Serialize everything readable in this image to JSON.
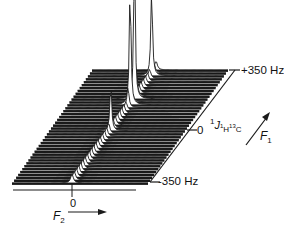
{
  "figure": {
    "type": "stacked 2D NMR plot (J-resolved)",
    "colors": {
      "trace": "#1a1a1a",
      "background": "#ffffff",
      "highlight": "#ffffff"
    }
  },
  "f1_axis": {
    "name": "F",
    "name_sub": "1",
    "top_tick": "+350 Hz",
    "mid_tick": "0",
    "bottom_tick": "-350 Hz",
    "coupling_label": {
      "pre_sup": "1",
      "J": "J",
      "sub_1": "1",
      "sub_H": "H",
      "sup_13": "13",
      "sub_C": "C"
    }
  },
  "f2_axis": {
    "name": "F",
    "name_sub": "2",
    "tick": "0"
  },
  "chart_data": {
    "type": "stacked-trace",
    "title": "",
    "xlabel": "F2",
    "ylabel": "F1 (1J 1H13C)",
    "f1_range_hz": [
      -350,
      350
    ],
    "f1_ticks": [
      "-350 Hz",
      "0",
      "+350 Hz"
    ],
    "f2_ticks": [
      "0"
    ],
    "num_traces": 40,
    "peaks": [
      {
        "label": "main",
        "f1_hz": 175,
        "relative_height": 1.0
      },
      {
        "label": "second",
        "f1_hz": 130,
        "relative_height": 0.85
      },
      {
        "label": "third",
        "f1_hz": 315,
        "relative_height": 0.45
      },
      {
        "label": "small",
        "f1_hz": -30,
        "relative_height": 0.25
      }
    ],
    "ridge": "diagonal ridge of small peaks running from F2=0, F1=-350 Hz to upper right at F1=+350 Hz"
  }
}
